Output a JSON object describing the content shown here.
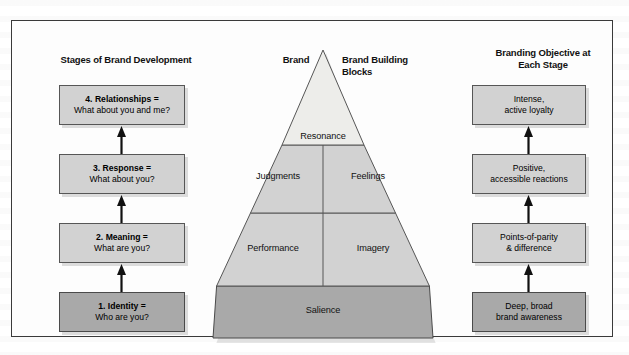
{
  "figure": {
    "headers": {
      "left": "Stages of Brand Development",
      "brand": "Brand",
      "blocks_line1": "Brand Building",
      "blocks_line2": "Blocks",
      "right_line1": "Branding Objective at",
      "right_line2": "Each Stage"
    },
    "stages": [
      {
        "id": "relationships",
        "title": "4. Relationships =",
        "question": "What about you and me?",
        "tone": "light"
      },
      {
        "id": "response",
        "title": "3. Response =",
        "question": "What about you?",
        "tone": "light"
      },
      {
        "id": "meaning",
        "title": "2. Meaning =",
        "question": "What are you?",
        "tone": "light"
      },
      {
        "id": "identity",
        "title": "1. Identity =",
        "question": "Who are you?",
        "tone": "dark"
      }
    ],
    "objectives": [
      {
        "id": "loyalty",
        "line1": "Intense,",
        "line2": "active loyalty",
        "tone": "light"
      },
      {
        "id": "reactions",
        "line1": "Positive,",
        "line2": "accessible reactions",
        "tone": "light"
      },
      {
        "id": "pop-pod",
        "line1": "Points-of-parity",
        "line2": "& difference",
        "tone": "light"
      },
      {
        "id": "awareness",
        "line1": "Deep, broad",
        "line2": "brand awareness",
        "tone": "dark"
      }
    ],
    "pyramid": {
      "tiers": [
        {
          "level": 4,
          "blocks": [
            "Resonance"
          ]
        },
        {
          "level": 3,
          "blocks": [
            "Judgments",
            "Feelings"
          ]
        },
        {
          "level": 2,
          "blocks": [
            "Performance",
            "Imagery"
          ]
        },
        {
          "level": 1,
          "blocks": [
            "Salience"
          ]
        }
      ],
      "labels": {
        "resonance": "Resonance",
        "judgments": "Judgments",
        "feelings": "Feelings",
        "performance": "Performance",
        "imagery": "Imagery",
        "salience": "Salience"
      }
    },
    "colors": {
      "tier_light": "#ededea",
      "tier_mid": "#d2d2d2",
      "tier_dark": "#a9a9a9",
      "outline": "#565656",
      "frame": "#3a3a3a",
      "text": "#111111"
    }
  }
}
